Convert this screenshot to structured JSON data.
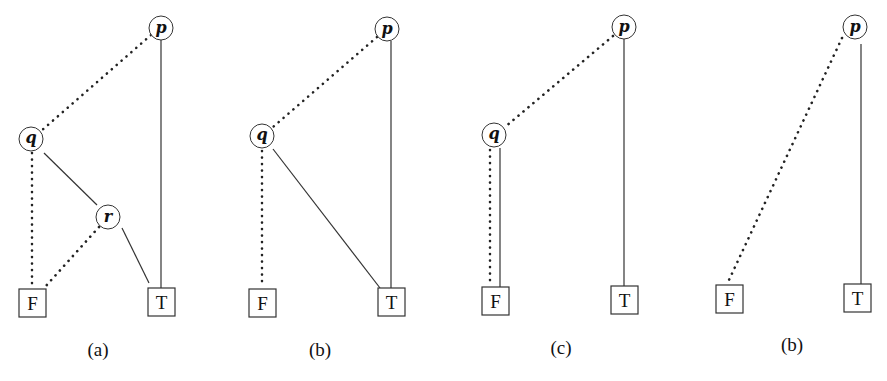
{
  "figure": {
    "legend": {
      "dotted_edge": "low (0) branch",
      "solid_edge": "high (1) branch"
    },
    "panels": [
      {
        "caption": "(a)",
        "nodes": [
          {
            "id": "p",
            "label": "p",
            "shape": "circle",
            "x": 161,
            "y": 28
          },
          {
            "id": "q",
            "label": "q",
            "shape": "circle",
            "x": 31,
            "y": 139
          },
          {
            "id": "r",
            "label": "r",
            "shape": "circle",
            "x": 108,
            "y": 217
          },
          {
            "id": "F",
            "label": "F",
            "shape": "box",
            "x": 33,
            "y": 303
          },
          {
            "id": "T",
            "label": "T",
            "shape": "box",
            "x": 161,
            "y": 302
          }
        ],
        "edges": [
          {
            "from": "p",
            "to": "q",
            "style": "dotted"
          },
          {
            "from": "p",
            "to": "T",
            "style": "solid"
          },
          {
            "from": "q",
            "to": "F",
            "style": "dotted"
          },
          {
            "from": "q",
            "to": "r",
            "style": "solid"
          },
          {
            "from": "r",
            "to": "F",
            "style": "dotted"
          },
          {
            "from": "r",
            "to": "T",
            "style": "solid"
          }
        ]
      },
      {
        "caption": "(b)",
        "nodes": [
          {
            "id": "p",
            "label": "p",
            "shape": "circle",
            "x": 387,
            "y": 29
          },
          {
            "id": "q",
            "label": "q",
            "shape": "circle",
            "x": 262,
            "y": 136
          },
          {
            "id": "F",
            "label": "F",
            "shape": "box",
            "x": 262,
            "y": 303
          },
          {
            "id": "T",
            "label": "T",
            "shape": "box",
            "x": 391,
            "y": 302
          }
        ],
        "edges": [
          {
            "from": "p",
            "to": "q",
            "style": "dotted"
          },
          {
            "from": "p",
            "to": "T",
            "style": "solid"
          },
          {
            "from": "q",
            "to": "F",
            "style": "dotted"
          },
          {
            "from": "q",
            "to": "T",
            "style": "solid"
          }
        ]
      },
      {
        "caption": "(c)",
        "nodes": [
          {
            "id": "p",
            "label": "p",
            "shape": "circle",
            "x": 624,
            "y": 27
          },
          {
            "id": "q",
            "label": "q",
            "shape": "circle",
            "x": 494,
            "y": 135
          },
          {
            "id": "F",
            "label": "F",
            "shape": "box",
            "x": 496,
            "y": 301
          },
          {
            "id": "T",
            "label": "T",
            "shape": "box",
            "x": 625,
            "y": 300
          }
        ],
        "edges": [
          {
            "from": "p",
            "to": "q",
            "style": "dotted"
          },
          {
            "from": "p",
            "to": "T",
            "style": "solid"
          },
          {
            "from": "q",
            "to": "F",
            "style": "dotted"
          },
          {
            "from": "q",
            "to": "F",
            "style": "solid"
          }
        ]
      },
      {
        "caption": "(b)",
        "nodes": [
          {
            "id": "p",
            "label": "p",
            "shape": "circle",
            "x": 855,
            "y": 27
          },
          {
            "id": "F",
            "label": "F",
            "shape": "box",
            "x": 729,
            "y": 299
          },
          {
            "id": "T",
            "label": "T",
            "shape": "box",
            "x": 857,
            "y": 299
          }
        ],
        "edges": [
          {
            "from": "p",
            "to": "F",
            "style": "dotted"
          },
          {
            "from": "p",
            "to": "T",
            "style": "solid"
          }
        ]
      }
    ]
  }
}
